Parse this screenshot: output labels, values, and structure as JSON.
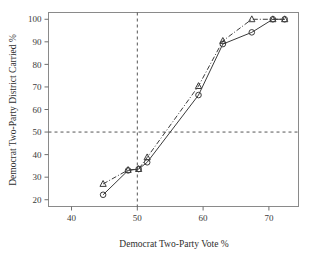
{
  "chart_data": {
    "type": "line",
    "title": "",
    "xlabel": "Democrat Two-Party Vote %",
    "ylabel": "Democrat Two-Party District Carried %",
    "xlim": [
      36.5,
      74.5
    ],
    "ylim": [
      17,
      103
    ],
    "xticks": [
      40,
      50,
      60,
      70
    ],
    "yticks": [
      20,
      30,
      40,
      50,
      60,
      70,
      80,
      90,
      100
    ],
    "xtick_labels": [
      "40",
      "50",
      "60",
      "70"
    ],
    "ytick_labels": [
      "20",
      "30",
      "40",
      "50",
      "60",
      "70",
      "80",
      "90",
      "100"
    ],
    "grid": false,
    "legend": "none",
    "reference_lines": [
      {
        "axis": "x",
        "value": 50,
        "style": "dashed"
      },
      {
        "axis": "y",
        "value": 50,
        "style": "dashed"
      }
    ],
    "series": [
      {
        "name": "circles",
        "marker": "circle",
        "line_style": "solid",
        "color": "#3b3b3b",
        "x": [
          44.8,
          48.6,
          50.2,
          51.5,
          59.3,
          63.0,
          67.4,
          70.6,
          72.4
        ],
        "y": [
          22.2,
          33.0,
          33.6,
          36.6,
          66.4,
          89.0,
          94.2,
          100.0,
          100.0
        ]
      },
      {
        "name": "triangles",
        "marker": "triangle",
        "line_style": "dash-dot",
        "color": "#3b3b3b",
        "x": [
          44.8,
          48.6,
          50.2,
          51.5,
          59.3,
          63.0,
          67.4,
          70.6,
          72.4
        ],
        "y": [
          27.0,
          33.2,
          33.6,
          38.8,
          70.4,
          90.4,
          100.0,
          100.0,
          100.0
        ]
      }
    ]
  }
}
